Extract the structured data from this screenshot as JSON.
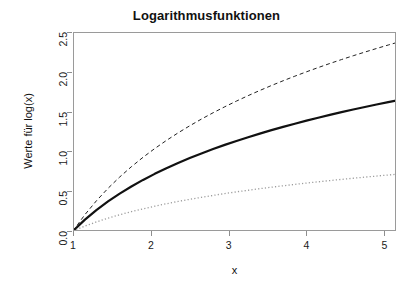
{
  "chart_data": {
    "type": "line",
    "title": "Logarithmusfunktionen",
    "xlabel": "x",
    "ylabel": "Werte für log(x)",
    "xlim": [
      1,
      5.15
    ],
    "ylim": [
      0,
      2.5
    ],
    "xticks": [
      1,
      2,
      3,
      4,
      5
    ],
    "xtick_labels": [
      "1",
      "2",
      "3",
      "4",
      "5"
    ],
    "yticks": [
      0.0,
      0.5,
      1.0,
      1.5,
      2.0,
      2.5
    ],
    "ytick_labels": [
      "0.0",
      "0.5",
      "1.0",
      "1.5",
      "2.0",
      "2.5"
    ],
    "grid": false,
    "legend": null,
    "x": [
      1.0,
      1.15,
      1.3,
      1.45,
      1.6,
      1.75,
      1.9,
      2.05,
      2.2,
      2.35,
      2.5,
      2.65,
      2.8,
      2.95,
      3.1,
      3.25,
      3.4,
      3.55,
      3.7,
      3.85,
      4.0,
      4.15,
      4.3,
      4.45,
      4.6,
      4.75,
      4.9,
      5.05,
      5.15
    ],
    "series": [
      {
        "name": "log2(x)",
        "style": "dashed",
        "color": "#222222",
        "width": 1,
        "values": [
          0.0,
          0.2016,
          0.3785,
          0.5361,
          0.6781,
          0.8074,
          0.926,
          1.0356,
          1.1375,
          1.2326,
          1.3219,
          1.406,
          1.4854,
          1.5607,
          1.6322,
          1.7004,
          1.7655,
          1.8278,
          1.8875,
          1.9449,
          2.0,
          2.0531,
          2.1044,
          2.1539,
          2.2016,
          2.2479,
          2.2928,
          2.3364,
          2.3648
        ]
      },
      {
        "name": "log(x)",
        "style": "solid",
        "color": "#111111",
        "width": 2.2,
        "values": [
          0.0,
          0.1398,
          0.2624,
          0.3716,
          0.47,
          0.5596,
          0.6419,
          0.7178,
          0.7885,
          0.8544,
          0.9163,
          0.9746,
          1.0296,
          1.0818,
          1.1314,
          1.1787,
          1.2238,
          1.2669,
          1.3083,
          1.3481,
          1.3863,
          1.4231,
          1.4586,
          1.4929,
          1.5261,
          1.5581,
          1.5892,
          1.6194,
          1.639
        ]
      },
      {
        "name": "log10(x)",
        "style": "dotted",
        "color": "#9c9c9c",
        "width": 1.3,
        "values": [
          0.0,
          0.0607,
          0.1139,
          0.1614,
          0.2041,
          0.243,
          0.2788,
          0.3118,
          0.3424,
          0.3711,
          0.3979,
          0.4232,
          0.4472,
          0.4698,
          0.4914,
          0.5119,
          0.5315,
          0.5502,
          0.5682,
          0.5855,
          0.6021,
          0.618,
          0.6335,
          0.6484,
          0.6628,
          0.6767,
          0.6902,
          0.7033,
          0.7118
        ]
      }
    ]
  }
}
